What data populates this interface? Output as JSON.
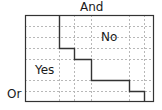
{
  "diagram": {
    "top_label": "And",
    "left_label": "Or",
    "region_labels": {
      "upper_right": "No",
      "lower_left": "Yes"
    },
    "box": {
      "x": 25,
      "y": 15,
      "w": 129,
      "h": 87
    },
    "grid": {
      "h_lines": [
        26,
        37,
        48,
        59,
        80,
        91
      ],
      "v_lines": [
        59,
        74,
        91,
        129,
        144
      ]
    },
    "staircase_points": "59,15 59,48 74,48 74,59 91,59 91,80 129,80 129,91 144,91 144,102",
    "colors": {
      "line": "#333333",
      "grid": "#b5b5b5",
      "text": "#1a1a1a"
    }
  }
}
